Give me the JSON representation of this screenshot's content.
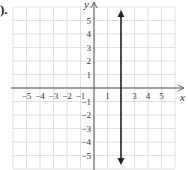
{
  "problem_label": ").",
  "chart_data": {
    "type": "line",
    "title": "",
    "xlabel": "x",
    "ylabel": "y",
    "xlim": [
      -6,
      6
    ],
    "ylim": [
      -6,
      6
    ],
    "grid": true,
    "x_ticks": [
      -5,
      -4,
      -3,
      -2,
      -1,
      1,
      3,
      4,
      5
    ],
    "x_tick_labels": [
      "−5",
      "−4",
      "−3",
      "−2",
      "−1",
      "1",
      "3",
      "4",
      "5"
    ],
    "y_ticks": [
      5,
      4,
      3,
      2,
      1,
      -1,
      -2,
      -3,
      -4,
      -5
    ],
    "y_tick_labels": [
      "5",
      "4",
      "3",
      "2",
      "1",
      "−1",
      "−2",
      "−3",
      "−4",
      "−5"
    ],
    "series": [
      {
        "name": "x = 2",
        "kind": "vertical_line",
        "x": 2,
        "arrows": "both",
        "color": "#222222"
      }
    ]
  }
}
